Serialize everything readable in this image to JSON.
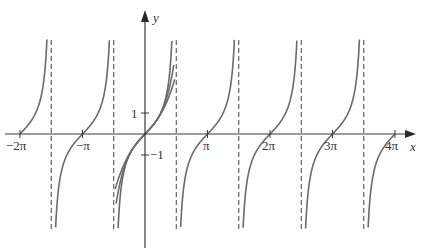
{
  "chart_data": {
    "type": "line",
    "title": "",
    "xlabel": "x",
    "ylabel": "y",
    "xlim": [
      -6.6,
      12.9
    ],
    "ylim": [
      -5.5,
      4.5
    ],
    "grid": false,
    "legend": null,
    "x_ticks": [
      {
        "value": -6.2832,
        "label": "−2π"
      },
      {
        "value": -3.1416,
        "label": "−π"
      },
      {
        "value": 3.1416,
        "label": "π"
      },
      {
        "value": 6.2832,
        "label": "2π"
      },
      {
        "value": 9.4248,
        "label": "3π"
      },
      {
        "value": 12.5664,
        "label": "4π"
      }
    ],
    "y_ticks": [
      {
        "value": 1,
        "label": "1"
      },
      {
        "value": -1,
        "label": "−1"
      }
    ],
    "asymptotes_x": [
      -4.7124,
      -1.5708,
      1.5708,
      4.7124,
      7.854,
      10.9956
    ],
    "series": [
      {
        "name": "y = tan x",
        "function": "tan",
        "domain": [
          -6.2832,
          12.5664
        ],
        "clip_y": [
          -4.5,
          4.5
        ]
      },
      {
        "name": "Taylor polynomial T3",
        "function": "x + x^3/3",
        "domain": [
          -1.5,
          1.5
        ],
        "clip_y": [
          -4.5,
          4.5
        ]
      },
      {
        "name": "Taylor polynomial T5",
        "function": "x + x^3/3 + 2x^5/15",
        "domain": [
          -1.45,
          1.45
        ],
        "clip_y": [
          -4.5,
          4.5
        ]
      }
    ]
  },
  "labels": {
    "x_axis": "x",
    "y_axis": "y",
    "x_ticks": [
      "−2π",
      "−π",
      "π",
      "2π",
      "3π",
      "4π"
    ],
    "y_tick_pos": "1",
    "y_tick_neg": "−1"
  },
  "colors": {
    "curve": "#6a6a6a",
    "axis": "#3a3a3a",
    "asymptote": "#444444",
    "background": "#ffffff"
  }
}
